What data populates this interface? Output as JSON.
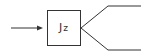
{
  "diagram": {
    "block": {
      "main": "J",
      "subscript": "z"
    },
    "input_arrow": {
      "label": ""
    },
    "outputs": [
      {
        "label": ""
      },
      {
        "label": ""
      }
    ],
    "colors": {
      "stroke": "#333333",
      "background": "#ffffff"
    }
  }
}
